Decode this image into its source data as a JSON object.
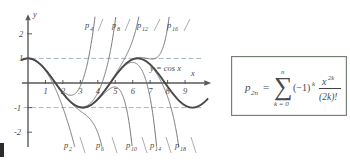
{
  "figure": {
    "axes": {
      "x_axis_label": "x",
      "y_axis_label": "y",
      "x_ticks": [
        "1",
        "2",
        "3",
        "4",
        "5",
        "6",
        "7",
        "8",
        "9"
      ],
      "y_ticks": [
        "2",
        "1",
        "-1",
        "-2"
      ],
      "x_range": [
        -0.35,
        10.3
      ],
      "y_range": [
        -2.6,
        2.7
      ],
      "guide_lines": [
        1,
        -1
      ]
    },
    "cos_label": "y = cos x",
    "curve_labels_top": [
      "p",
      "p",
      "p",
      "p"
    ],
    "curve_labels_bottom": [
      "p",
      "p",
      "p",
      "p",
      "p"
    ],
    "top_subscripts": [
      "4",
      "8",
      "12",
      "16"
    ],
    "bottom_subscripts": [
      "2",
      "6",
      "10",
      "14",
      "18"
    ]
  },
  "formula": {
    "lhs_base": "p",
    "lhs_sub": "2n",
    "equals": "=",
    "sum_glyph": "∑",
    "sum_upper": "n",
    "sum_lower": "k = 0",
    "sign_term": "(−1)",
    "sign_exp": "k",
    "numerator_base": "x",
    "numerator_exp": "2k",
    "denominator": "(2k)!"
  },
  "chart_data": {
    "type": "line",
    "title": "",
    "xlabel": "x",
    "ylabel": "y",
    "xlim": [
      -0.35,
      10.3
    ],
    "ylim": [
      -2.6,
      2.7
    ],
    "grid": false,
    "legend": "inline-curve-labels",
    "xticks": [
      1,
      2,
      3,
      4,
      5,
      6,
      7,
      8,
      9
    ],
    "yticks": [
      2,
      1,
      -1,
      -2
    ],
    "reference_lines": [
      {
        "type": "horizontal",
        "y": 1,
        "style": "dashed"
      },
      {
        "type": "horizontal",
        "y": -1,
        "style": "dashed"
      }
    ],
    "annotations": [
      {
        "text": "y = cos x",
        "x": 6.6,
        "y": 0.62
      },
      {
        "text": "p4",
        "x": 3.1,
        "y": 2.4
      },
      {
        "text": "p8",
        "x": 4.6,
        "y": 2.4
      },
      {
        "text": "p12",
        "x": 6.1,
        "y": 2.4
      },
      {
        "text": "p16",
        "x": 7.8,
        "y": 2.4
      },
      {
        "text": "p2",
        "x": 1.9,
        "y": -2.4
      },
      {
        "text": "p6",
        "x": 3.8,
        "y": -2.4
      },
      {
        "text": "p10",
        "x": 5.7,
        "y": -2.4
      },
      {
        "text": "p14",
        "x": 7.1,
        "y": -2.4
      },
      {
        "text": "p18",
        "x": 8.6,
        "y": -2.4
      }
    ],
    "series": [
      {
        "name": "y = cos x",
        "formula": "cos(x)",
        "degree": null,
        "emphasis": "thick"
      },
      {
        "name": "p2",
        "formula": "1 - x^2/2!",
        "degree": 2
      },
      {
        "name": "p4",
        "formula": "1 - x^2/2! + x^4/4!",
        "degree": 4
      },
      {
        "name": "p6",
        "formula": "1 - x^2/2! + x^4/4! - x^6/6!",
        "degree": 6
      },
      {
        "name": "p8",
        "formula": "sum_{k=0}^{4} (-1)^k x^{2k}/(2k)!",
        "degree": 8
      },
      {
        "name": "p10",
        "formula": "sum_{k=0}^{5} (-1)^k x^{2k}/(2k)!",
        "degree": 10
      },
      {
        "name": "p12",
        "formula": "sum_{k=0}^{6} (-1)^k x^{2k}/(2k)!",
        "degree": 12
      },
      {
        "name": "p14",
        "formula": "sum_{k=0}^{7} (-1)^k x^{2k}/(2k)!",
        "degree": 14
      },
      {
        "name": "p16",
        "formula": "sum_{k=0}^{8} (-1)^k x^{2k}/(2k)!",
        "degree": 16
      },
      {
        "name": "p18",
        "formula": "sum_{k=0}^{9} (-1)^k x^{2k}/(2k)!",
        "degree": 18
      }
    ]
  }
}
